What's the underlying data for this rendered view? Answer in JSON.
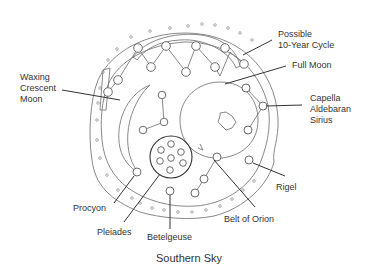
{
  "diagram": {
    "caption": "Southern Sky",
    "labels": {
      "waxing_crescent": [
        "Waxing",
        "Crescent",
        "Moon"
      ],
      "possible_cycle": [
        "Possible",
        "10-Year Cycle"
      ],
      "full_moon": "Full Moon",
      "capella_group": [
        "Capella",
        "Aldebaran",
        "Sirius"
      ],
      "rigel": "Rigel",
      "belt_of_orion": "Belt of Orion",
      "betelgeuse": "Betelgeuse",
      "pleiades": "Pleiades",
      "procyon": "Procyon"
    },
    "colors": {
      "line": "#7a7a7a",
      "text": "#333333",
      "background": "#ffffff"
    }
  }
}
